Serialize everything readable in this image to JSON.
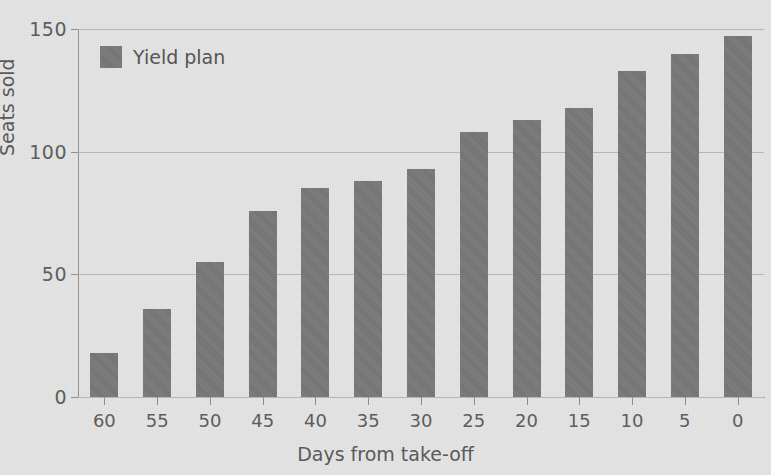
{
  "chart_data": {
    "type": "bar",
    "title": "",
    "xlabel": "Days from take-off",
    "ylabel": "Seats sold",
    "categories": [
      "60",
      "55",
      "50",
      "45",
      "40",
      "35",
      "30",
      "25",
      "20",
      "15",
      "10",
      "5",
      "0"
    ],
    "values": [
      18,
      36,
      55,
      76,
      85,
      88,
      93,
      108,
      113,
      118,
      133,
      140,
      147
    ],
    "series": [
      {
        "name": "Yield plan",
        "values": [
          18,
          36,
          55,
          76,
          85,
          88,
          93,
          108,
          113,
          118,
          133,
          140,
          147
        ]
      }
    ],
    "ylim": [
      0,
      150
    ],
    "yticks": [
      0,
      50,
      100,
      150
    ],
    "ytick_labels": [
      "0",
      "50",
      "100",
      "150"
    ],
    "grid": true,
    "legend": {
      "position": "top-left",
      "entries": [
        "Yield plan"
      ]
    },
    "colors": {
      "bar": "#787878",
      "background": "#e4e4e4",
      "axis": "#8e8e8e",
      "gridline": "#b6b6b6",
      "text": "#575757"
    }
  }
}
